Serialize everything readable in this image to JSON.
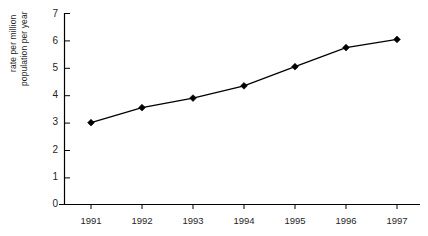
{
  "chart_data": {
    "type": "line",
    "title": "",
    "xlabel": "",
    "ylabel": "rate per million population per year",
    "ylabel_lines": [
      "rate per million",
      "population  per year"
    ],
    "categories": [
      "1991",
      "1992",
      "1993",
      "1994",
      "1995",
      "1996",
      "1997"
    ],
    "values": [
      3.0,
      3.55,
      3.9,
      4.35,
      5.05,
      5.75,
      6.05
    ],
    "series": [
      {
        "name": "rate per million population per year",
        "values": [
          3.0,
          3.55,
          3.9,
          4.35,
          5.05,
          5.75,
          6.05
        ]
      }
    ],
    "ylim": [
      0,
      7
    ],
    "yticks": [
      "0",
      "1",
      "2",
      "3",
      "4",
      "5",
      "6",
      "7"
    ],
    "ytick_values": [
      0,
      1,
      2,
      3,
      4,
      5,
      6,
      7
    ],
    "xticks": [
      "1991",
      "1992",
      "1993",
      "1994",
      "1995",
      "1996",
      "1997"
    ],
    "grid": false,
    "legend": "none",
    "marker": "diamond",
    "line_color": "#000000",
    "marker_color": "#000000",
    "axis_color": "#000000",
    "background_color": "#ffffff"
  }
}
